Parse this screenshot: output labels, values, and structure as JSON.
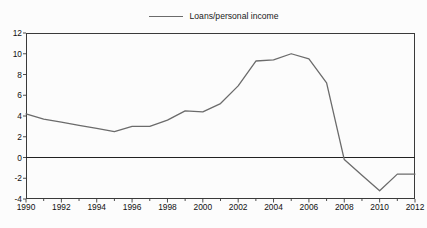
{
  "chart_data": {
    "type": "line",
    "title": "",
    "subtitle": "",
    "xlabel": "",
    "ylabel": "",
    "xlim": [
      1990,
      2012
    ],
    "ylim": [
      -4,
      12
    ],
    "grid": false,
    "legend_position": "top-center",
    "zero_line": 0,
    "y_ticks": [
      12,
      10,
      8,
      6,
      4,
      2,
      0,
      -2,
      -4
    ],
    "x_ticks": [
      1990,
      1992,
      1994,
      1996,
      1998,
      2000,
      2002,
      2004,
      2006,
      2008,
      2010,
      2012
    ],
    "x_minor_tick_step": 1,
    "series": [
      {
        "name": "Loans/personal income",
        "color": "#6b6b6b",
        "x": [
          1990,
          1991,
          1992,
          1993,
          1994,
          1995,
          1996,
          1997,
          1998,
          1999,
          2000,
          2001,
          2002,
          2003,
          2004,
          2005,
          2006,
          2007,
          2008,
          2009,
          2010,
          2011,
          2012
        ],
        "values": [
          4.2,
          3.7,
          3.4,
          3.1,
          2.8,
          2.5,
          3.0,
          3.0,
          3.6,
          4.5,
          4.4,
          5.2,
          6.9,
          9.3,
          9.4,
          10.0,
          9.5,
          7.2,
          -0.2,
          -1.7,
          -3.2,
          -1.6,
          -1.6
        ]
      }
    ]
  },
  "legend": {
    "items": [
      {
        "label": "Loans/personal income",
        "color": "#6b6b6b"
      }
    ]
  },
  "axis": {
    "y_tick_labels": [
      "12",
      "10",
      "8",
      "6",
      "4",
      "2",
      "0",
      "-2",
      "-4"
    ],
    "x_tick_labels": [
      "1990",
      "1992",
      "1994",
      "1996",
      "1998",
      "2000",
      "2002",
      "2004",
      "2006",
      "2008",
      "2010",
      "2012"
    ]
  },
  "colors": {
    "line": "#6b6b6b",
    "frame": "#3a3a3a",
    "zero_line": "#222222",
    "text": "#111111",
    "background": "#fcfcfc"
  }
}
